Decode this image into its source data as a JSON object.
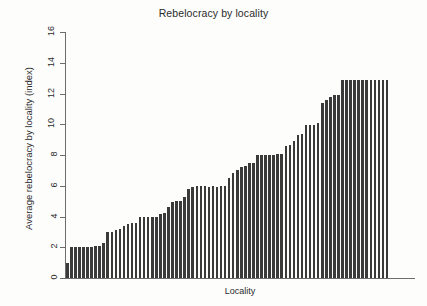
{
  "chart_data": {
    "type": "bar",
    "title": "Rebelocracy by locality",
    "xlabel": "Locality",
    "ylabel": "Average rebelocracy by locality (index)",
    "ylim": [
      0,
      16
    ],
    "yticks": [
      0,
      2,
      4,
      6,
      8,
      10,
      12,
      14,
      16
    ],
    "ytick_labels": [
      "0",
      "2",
      "4",
      "6",
      "8",
      "10",
      "12",
      "14",
      "16"
    ],
    "grid": false,
    "legend": "none",
    "bar_color": "#3a3a3a",
    "sorted": "ascending",
    "n_bars": 80,
    "categories": [
      "1",
      "2",
      "3",
      "4",
      "5",
      "6",
      "7",
      "8",
      "9",
      "10",
      "11",
      "12",
      "13",
      "14",
      "15",
      "16",
      "17",
      "18",
      "19",
      "20",
      "21",
      "22",
      "23",
      "24",
      "25",
      "26",
      "27",
      "28",
      "29",
      "30",
      "31",
      "32",
      "33",
      "34",
      "35",
      "36",
      "37",
      "38",
      "39",
      "40",
      "41",
      "42",
      "43",
      "44",
      "45",
      "46",
      "47",
      "48",
      "49",
      "50",
      "51",
      "52",
      "53",
      "54",
      "55",
      "56",
      "57",
      "58",
      "59",
      "60",
      "61",
      "62",
      "63",
      "64",
      "65",
      "66",
      "67",
      "68",
      "69",
      "70",
      "71",
      "72",
      "73",
      "74",
      "75",
      "76",
      "77",
      "78",
      "79",
      "80"
    ],
    "values": [
      1.0,
      2.0,
      2.0,
      2.0,
      2.0,
      2.0,
      2.0,
      2.05,
      2.1,
      2.3,
      3.0,
      3.0,
      3.1,
      3.2,
      3.4,
      3.5,
      3.6,
      3.6,
      4.0,
      4.0,
      4.0,
      4.0,
      4.0,
      4.15,
      4.2,
      4.6,
      4.95,
      5.0,
      5.0,
      5.25,
      5.8,
      5.9,
      6.0,
      6.0,
      6.0,
      5.95,
      6.0,
      5.95,
      6.0,
      6.0,
      6.5,
      6.8,
      7.0,
      7.2,
      7.3,
      7.5,
      7.5,
      8.0,
      8.0,
      8.0,
      8.0,
      8.0,
      8.05,
      8.05,
      8.6,
      8.65,
      8.9,
      9.3,
      9.35,
      9.95,
      9.95,
      9.95,
      10.1,
      11.4,
      11.6,
      11.75,
      11.9,
      11.9,
      12.9,
      12.9,
      12.9,
      12.9,
      12.9,
      12.9,
      12.9,
      12.9,
      12.9,
      12.9,
      12.9,
      12.9
    ]
  }
}
